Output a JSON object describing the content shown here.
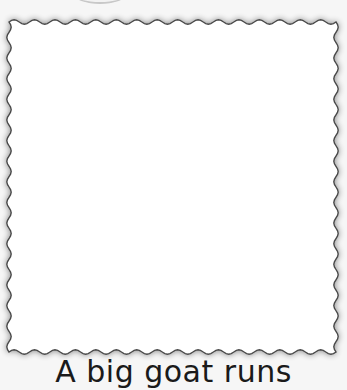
{
  "worksheet": {
    "drawing_frame": {
      "style": "wavy-border",
      "border_color": "#4a4a4a",
      "fill": "#ffffff"
    },
    "caption": "A big goat runs"
  }
}
